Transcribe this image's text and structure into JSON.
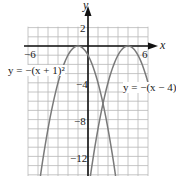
{
  "chart_data": {
    "type": "line",
    "title": "",
    "xlabel": "x",
    "ylabel": "y",
    "xlim": [
      -6,
      6
    ],
    "ylim": [
      -14,
      2
    ],
    "grid": true,
    "x_ticks_labeled": [
      "-6",
      "6"
    ],
    "y_ticks_labeled": [
      "2",
      "-4",
      "-8",
      "-12"
    ],
    "series": [
      {
        "name": "y = -(x+1)^2",
        "label": "y = −(x + 1)²",
        "color": "#7a7a7a",
        "vertex": [
          -1,
          0
        ],
        "x": [
          -4.8,
          -4,
          -3,
          -2,
          -1,
          0,
          1,
          2,
          2.8
        ],
        "y": [
          -14.44,
          -9,
          -4,
          -1,
          0,
          -1,
          -4,
          -9,
          -14.44
        ]
      },
      {
        "name": "y = -(x-4)^2",
        "label": "y = −(x − 4)²",
        "color": "#7a7a7a",
        "vertex": [
          4,
          0
        ],
        "x": [
          0.2,
          1,
          2,
          3,
          4,
          5,
          6
        ],
        "y": [
          -14.44,
          -9,
          -4,
          -1,
          0,
          -1,
          -4
        ]
      }
    ],
    "annotations": [
      "y = −(x + 1)²",
      "y = −(x − 4)²"
    ]
  },
  "labels": {
    "x_axis": "x",
    "y_axis": "y",
    "tick_neg6": "−6",
    "tick_6": "6",
    "tick_2": "2",
    "tick_neg4": "−4",
    "tick_neg8": "−8",
    "tick_neg12": "−12",
    "curve1_label": "y = −(x + 1)²",
    "curve2_label": "y = −(x − 4)²"
  },
  "colors": {
    "grid": "#b8b8b8",
    "axis": "#111111",
    "curve": "#7a7a7a"
  }
}
